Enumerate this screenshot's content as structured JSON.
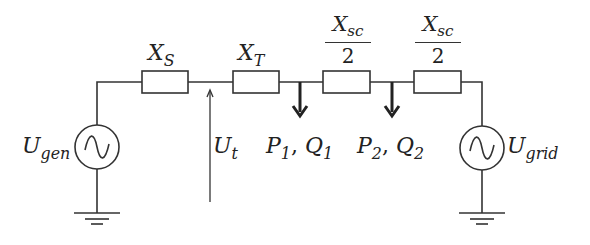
{
  "diagram": {
    "type": "single-line electrical circuit diagram",
    "stroke_color": "#333333",
    "components": {
      "generator": {
        "symbol": "ac-source",
        "label": {
          "main": "U",
          "sub": "gen"
        }
      },
      "reactance_s": {
        "symbol": "impedance-box",
        "label": {
          "main": "X",
          "sub": "S"
        }
      },
      "reactance_t": {
        "symbol": "impedance-box",
        "label": {
          "main": "X",
          "sub": "T"
        }
      },
      "reactance_sc_1": {
        "symbol": "impedance-box",
        "label": {
          "main": "X",
          "sub": "sc",
          "denominator": "2"
        }
      },
      "reactance_sc_2": {
        "symbol": "impedance-box",
        "label": {
          "main": "X",
          "sub": "sc",
          "denominator": "2"
        }
      },
      "grid": {
        "symbol": "ac-source",
        "label": {
          "main": "U",
          "sub": "grid"
        }
      },
      "terminal_voltage": {
        "symbol": "voltage-arrow",
        "label": {
          "main": "U",
          "sub": "t"
        }
      },
      "load_1": {
        "symbol": "load-arrow",
        "label": {
          "p": "P",
          "p_sub": "1",
          "sep": ", ",
          "q": "Q",
          "q_sub": "1"
        }
      },
      "load_2": {
        "symbol": "load-arrow",
        "label": {
          "p": "P",
          "p_sub": "2",
          "sep": ", ",
          "q": "Q",
          "q_sub": "2"
        }
      }
    }
  }
}
